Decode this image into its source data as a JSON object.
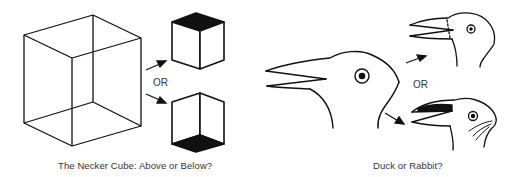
{
  "panels": [
    {
      "id": "necker-cube",
      "caption": "The Necker Cube: Above or Below?",
      "or_label": "OR",
      "figures": [
        "wireframe-cube",
        "cube-viewed-from-above",
        "cube-viewed-from-below"
      ]
    },
    {
      "id": "duck-rabbit",
      "caption": "Duck or Rabbit?",
      "or_label": "OR",
      "figures": [
        "duck-rabbit-head",
        "duck-interpretation",
        "rabbit-interpretation"
      ]
    }
  ],
  "colors": {
    "ink": "#111111",
    "background": "#ffffff",
    "caption": "#333333"
  }
}
